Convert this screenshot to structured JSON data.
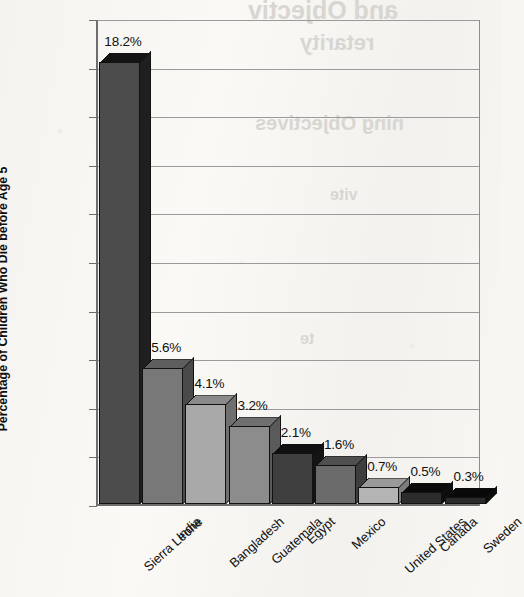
{
  "page": {
    "background_color": "#f7f6f3",
    "bleed_through_texts": [
      {
        "text": "and Objectiv",
        "x": 248,
        "y": -4,
        "size": 25
      },
      {
        "text": "retarity",
        "x": 300,
        "y": 30,
        "size": 22
      },
      {
        "text": "ning Objectives",
        "x": 255,
        "y": 112,
        "size": 20
      },
      {
        "text": "vite",
        "x": 330,
        "y": 186,
        "size": 16
      },
      {
        "text": "te",
        "x": 300,
        "y": 330,
        "size": 16
      }
    ]
  },
  "chart_data": {
    "type": "bar",
    "title": "",
    "xlabel": "",
    "ylabel": "Percentage of Children Who Die before Age 5",
    "ylim": [
      0,
      20
    ],
    "ytick_step": 2,
    "ytick_labels": [
      "20%",
      "18%",
      "16%",
      "14%",
      "12%",
      "10%",
      "8%",
      "6%",
      "4%",
      "2%",
      "0%"
    ],
    "ytick_values": [
      20,
      18,
      16,
      14,
      12,
      10,
      8,
      6,
      4,
      2,
      0
    ],
    "grid": true,
    "grid_axis": "y",
    "legend": false,
    "value_label_suffix": "%",
    "style": "3d-bar",
    "categories": [
      "Sierra Leone",
      "India",
      "Bangladesh",
      "Guatemala",
      "Egypt",
      "Mexico",
      "United States",
      "Canada",
      "Sweden"
    ],
    "values": [
      18.2,
      5.6,
      4.1,
      3.2,
      2.1,
      1.6,
      0.7,
      0.5,
      0.3
    ],
    "value_labels": [
      "18.2%",
      "5.6%",
      "4.1%",
      "3.2%",
      "2.1%",
      "1.6%",
      "0.7%",
      "0.5%",
      "0.3%"
    ],
    "bar_colors": [
      "#4c4c4c",
      "#787878",
      "#a9a9a9",
      "#8c8c8c",
      "#3f3f3f",
      "#6b6b6b",
      "#b4b4b4",
      "#2c2c2c",
      "#2a2a2a"
    ],
    "bar_side_colors": [
      "#1f1f1f",
      "#4a4a4a",
      "#6f6f6f",
      "#5a5a5a",
      "#141414",
      "#3d3d3d",
      "#7d7d7d",
      "#0e0e0e",
      "#0c0c0c"
    ],
    "bar_top_colors": [
      "#141414",
      "#5e5e5e",
      "#8a8a8a",
      "#6f6f6f",
      "#101010",
      "#4f4f4f",
      "#9a9a9a",
      "#0a0a0a",
      "#090909"
    ],
    "axis_color": "#6e6e6e",
    "gridline_color": "#9a9a9a",
    "text_color": "#101010"
  }
}
